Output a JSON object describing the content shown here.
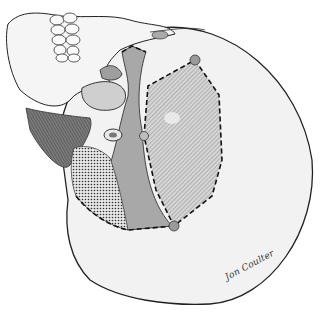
{
  "illustration": {
    "subject": "skull-inferior-view-with-marked-regions",
    "signature": "Jon Coulter",
    "colors": {
      "bone_fill": "#f2f2f2",
      "outline": "#222222",
      "hatched_region": "#bdbdbd",
      "gray_region": "#a8a8a8",
      "muscle_dark": "#6e6e6e",
      "landmark_dot": "#9a9a9a",
      "dashed_line": "#111111"
    },
    "landmarks": [
      {
        "name": "upper-landmark",
        "x": 195,
        "y": 60
      },
      {
        "name": "middle-landmark",
        "x": 144,
        "y": 136
      },
      {
        "name": "lower-landmark",
        "x": 174,
        "y": 226
      }
    ]
  }
}
